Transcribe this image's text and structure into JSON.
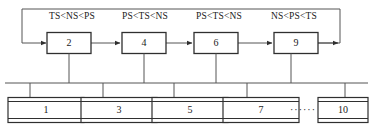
{
  "diagram": {
    "colors": {
      "line": "#3a3a3a",
      "text": "#1a1a1a",
      "background": "#ffffff"
    },
    "stage_nodes": [
      {
        "id": "stage-2",
        "label": "2",
        "cx": 69,
        "cy": 43,
        "w": 44,
        "h": 21
      },
      {
        "id": "stage-4",
        "label": "4",
        "cx": 144,
        "cy": 43,
        "w": 44,
        "h": 21
      },
      {
        "id": "stage-6",
        "label": "6",
        "cx": 216,
        "cy": 43,
        "w": 44,
        "h": 21
      },
      {
        "id": "stage-9",
        "label": "9",
        "cx": 296,
        "cy": 43,
        "w": 44,
        "h": 21
      }
    ],
    "condition_labels": [
      {
        "id": "cond-1",
        "text": "TS<NS<PS",
        "cx": 72,
        "y": 17
      },
      {
        "id": "cond-2",
        "text": "PS<TS<NS",
        "cx": 145,
        "y": 17
      },
      {
        "id": "cond-3",
        "text": "PS<TS<NS",
        "cx": 219,
        "y": 17
      },
      {
        "id": "cond-4",
        "text": "NS<PS<TS",
        "cx": 294,
        "y": 17
      }
    ],
    "leaf_nodes": [
      {
        "id": "leaf-1",
        "label": "1",
        "cx": 46,
        "cy": 110,
        "w": 76,
        "h": 26
      },
      {
        "id": "leaf-3",
        "label": "3",
        "cx": 119,
        "cy": 110,
        "w": 76,
        "h": 26
      },
      {
        "id": "leaf-5",
        "label": "5",
        "cx": 190,
        "cy": 110,
        "w": 76,
        "h": 26
      },
      {
        "id": "leaf-7",
        "label": "7",
        "cx": 261,
        "cy": 110,
        "w": 76,
        "h": 26
      },
      {
        "id": "leaf-10",
        "label": "10",
        "cx": 338,
        "cy": 110,
        "w": 76,
        "h": 26
      }
    ],
    "ellipsis": {
      "id": "leaf-ellipsis",
      "text": "······",
      "cx": 303,
      "cy": 110
    },
    "bus": {
      "x1": 5,
      "x2": 368,
      "y": 83
    },
    "bus_drops_up": [
      {
        "id": "drop-stage-2",
        "x": 69,
        "y_top": 54,
        "y_bottom": 83
      },
      {
        "id": "drop-stage-4",
        "x": 144,
        "y_top": 54,
        "y_bottom": 83
      },
      {
        "id": "drop-stage-6",
        "x": 216,
        "y_top": 54,
        "y_bottom": 83
      },
      {
        "id": "drop-stage-9",
        "x": 291,
        "y_top": 54,
        "y_bottom": 83
      }
    ],
    "bus_drops_down": [
      {
        "id": "drop-leaf-1",
        "x": 30,
        "y_top": 83,
        "y_bottom": 97
      },
      {
        "id": "drop-leaf-3",
        "x": 103,
        "y_top": 83,
        "y_bottom": 97
      },
      {
        "id": "drop-leaf-5",
        "x": 174,
        "y_top": 83,
        "y_bottom": 97
      },
      {
        "id": "drop-leaf-7",
        "x": 247,
        "y_top": 83,
        "y_bottom": 97
      },
      {
        "id": "drop-leaf-10",
        "x": 345,
        "y_top": 83,
        "y_bottom": 97
      }
    ],
    "stage_arrows": [
      {
        "id": "arrow-2-to-4",
        "x1": 91,
        "x2": 120,
        "y": 43
      },
      {
        "id": "arrow-4-to-6",
        "x1": 166,
        "x2": 192,
        "y": 43
      },
      {
        "id": "arrow-6-to-9",
        "x1": 238,
        "x2": 272,
        "y": 43
      }
    ],
    "feedback_loop": {
      "id": "feedback-loop",
      "description": "output of stage 9 routes right, up, left across the top and back down into stage 2",
      "exit_x": 318,
      "right_x": 340,
      "top_y": 9,
      "left_x": 22,
      "entry_y": 43,
      "entry_x": 46
    }
  }
}
